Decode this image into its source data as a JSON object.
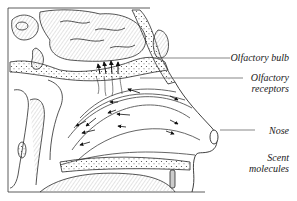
{
  "diagram": {
    "labels": [
      {
        "id": "olfactory-bulb",
        "text": "Olfactory bulb"
      },
      {
        "id": "olfactory-receptors",
        "line1": "Olfactory",
        "line2": "receptors"
      },
      {
        "id": "nose",
        "text": "Nose"
      },
      {
        "id": "scent-molecules",
        "line1": "Scent",
        "line2": "molecules"
      }
    ],
    "colors": {
      "line": "#2a2a2a",
      "shade": "#9a9a9a",
      "leader": "#555555",
      "background": "#ffffff"
    }
  }
}
